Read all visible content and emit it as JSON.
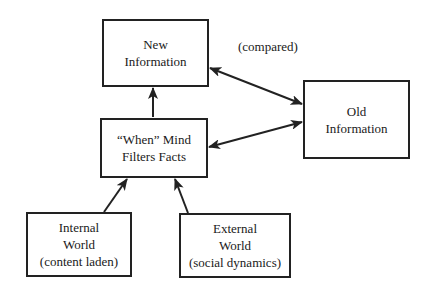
{
  "diagram": {
    "title": "",
    "nodes": {
      "new_info": {
        "id": "new_info",
        "lines": [
          "New",
          "Information"
        ]
      },
      "old_info": {
        "id": "old_info",
        "lines": [
          "Old",
          "Information"
        ]
      },
      "filter": {
        "id": "filter",
        "lines": [
          "“When” Mind",
          "Filters Facts"
        ]
      },
      "internal": {
        "id": "internal",
        "lines": [
          "Internal",
          "World",
          "(content laden)"
        ]
      },
      "external": {
        "id": "external",
        "lines": [
          "External",
          "World",
          "(social dynamics)"
        ]
      }
    },
    "edges": [
      {
        "id": "new-old",
        "from": "new_info",
        "to": "old_info",
        "direction": "both",
        "label": "(compared)"
      },
      {
        "id": "filter-old",
        "from": "filter",
        "to": "old_info",
        "direction": "both",
        "label": ""
      },
      {
        "id": "filter-new",
        "from": "filter",
        "to": "new_info",
        "direction": "forward",
        "label": ""
      },
      {
        "id": "internal-filter",
        "from": "internal",
        "to": "filter",
        "direction": "forward",
        "label": ""
      },
      {
        "id": "external-filter",
        "from": "external",
        "to": "filter",
        "direction": "forward",
        "label": ""
      }
    ],
    "colors": {
      "stroke": "#222222",
      "text": "#1a1a1a",
      "background": "#ffffff"
    }
  }
}
